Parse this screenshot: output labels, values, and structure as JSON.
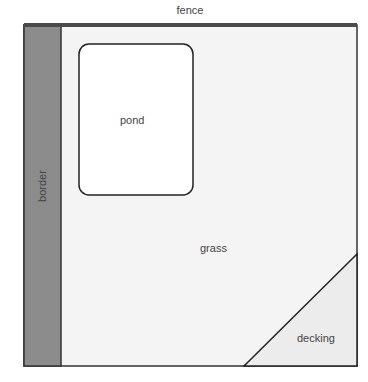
{
  "diagram": {
    "type": "garden-plan",
    "labels": {
      "fence": "fence",
      "border": "border",
      "pond": "pond",
      "grass": "grass",
      "decking": "decking"
    },
    "colors": {
      "fence": "#4a4a4a",
      "border": "#8c8c8c",
      "grass": "#f4f4f4",
      "pond": "#ffffff",
      "decking": "#ececec",
      "outline": "#222222"
    }
  }
}
